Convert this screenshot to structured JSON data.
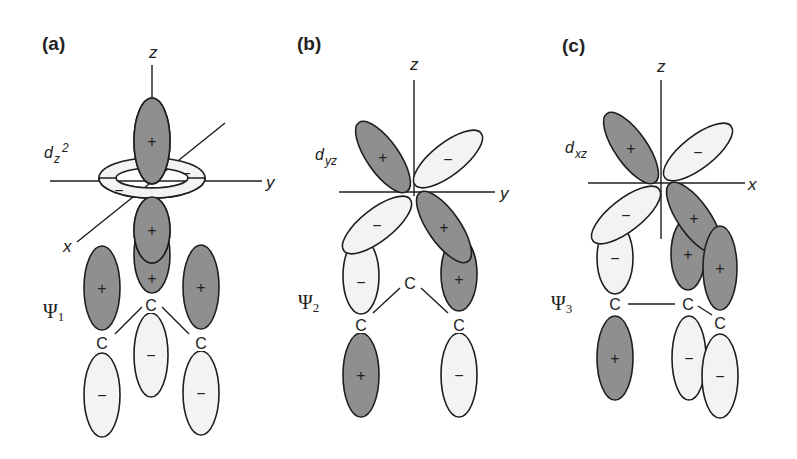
{
  "colors": {
    "positive": "#8f8f8f",
    "negative": "#f3f3f3",
    "stroke": "#1e1e1e",
    "background": "#ffffff"
  },
  "panels": [
    {
      "id": "a",
      "label": "(a)",
      "label_pos": [
        42,
        50
      ],
      "orbital": {
        "main": "d",
        "sub": "z",
        "sup": "2",
        "pos": [
          44,
          158
        ]
      },
      "psi": {
        "main": "Ψ",
        "sub": "1",
        "pos": [
          43,
          318
        ]
      },
      "axes": [
        {
          "x1": 152,
          "y1": 65,
          "x2": 152,
          "y2": 100,
          "label": "z",
          "lx": 149,
          "ly": 58
        },
        {
          "x1": 50,
          "y1": 181,
          "x2": 262,
          "y2": 181,
          "label": "y",
          "lx": 266,
          "ly": 188
        },
        {
          "x1": 225,
          "y1": 123,
          "x2": 77,
          "y2": 242,
          "label": "x",
          "lx": 63,
          "ly": 252
        }
      ],
      "ring": {
        "cx": 152,
        "cy": 178,
        "rx": 53,
        "ry": 20,
        "irx": 36,
        "iry": 10,
        "signs": [
          {
            "t": "−",
            "x": 119,
            "y": 191
          },
          {
            "t": "−",
            "x": 186,
            "y": 174
          }
        ]
      },
      "lobes": [
        {
          "cx": 102,
          "cy": 288,
          "rx": 18,
          "ry": 42,
          "rot": 0,
          "sign": "+"
        },
        {
          "cx": 201,
          "cy": 287,
          "rx": 18,
          "ry": 42,
          "rot": 0,
          "sign": "+"
        },
        {
          "cx": 152,
          "cy": 255,
          "rx": 18,
          "ry": 38,
          "rot": 0,
          "sign": "+",
          "sy": 278
        },
        {
          "cx": 152,
          "cy": 230,
          "rx": 18,
          "ry": 33,
          "rot": 0,
          "sign": "+"
        },
        {
          "cx": 152,
          "cy": 141,
          "rx": 18,
          "ry": 43,
          "rot": 0,
          "sign": "+"
        },
        {
          "cx": 102,
          "cy": 395,
          "rx": 18,
          "ry": 42,
          "rot": 0,
          "sign": "−"
        },
        {
          "cx": 151,
          "cy": 355,
          "rx": 17,
          "ry": 42,
          "rot": 0,
          "sign": "−"
        },
        {
          "cx": 201,
          "cy": 393,
          "rx": 18,
          "ry": 42,
          "rot": 0,
          "sign": "−"
        }
      ],
      "atoms": [
        {
          "t": "C",
          "x": 151,
          "y": 311
        },
        {
          "t": "C",
          "x": 102,
          "y": 349
        },
        {
          "t": "C",
          "x": 201,
          "y": 349
        }
      ],
      "bonds": [
        [
          142,
          307,
          115,
          334
        ],
        [
          162,
          307,
          189,
          334
        ]
      ]
    },
    {
      "id": "b",
      "label": "(b)",
      "label_pos": [
        297,
        50
      ],
      "orbital": {
        "main": "d",
        "sub": "yz",
        "sup": "",
        "pos": [
          315,
          160
        ]
      },
      "psi": {
        "main": "Ψ",
        "sub": "2",
        "pos": [
          298,
          309
        ]
      },
      "axes": [
        {
          "x1": 414,
          "y1": 80,
          "x2": 414,
          "y2": 196,
          "label": "z",
          "lx": 410,
          "ly": 70
        },
        {
          "x1": 339,
          "y1": 192,
          "x2": 495,
          "y2": 192,
          "label": "y",
          "lx": 500,
          "ly": 199
        }
      ],
      "lobes": [
        {
          "cx": 361,
          "cy": 276,
          "rx": 18,
          "ry": 38,
          "rot": 0,
          "sign": "−",
          "sy": 282
        },
        {
          "cx": 459,
          "cy": 274,
          "rx": 18,
          "ry": 37,
          "rot": 0,
          "sign": "+",
          "sy": 279
        },
        {
          "cx": 383,
          "cy": 157,
          "rx": 16,
          "ry": 42,
          "rot": -35,
          "sign": "+"
        },
        {
          "cx": 448,
          "cy": 159,
          "rx": 16,
          "ry": 42,
          "rot": 52,
          "sign": "−"
        },
        {
          "cx": 377,
          "cy": 225,
          "rx": 16,
          "ry": 42,
          "rot": 52,
          "sign": "−"
        },
        {
          "cx": 444,
          "cy": 227,
          "rx": 16,
          "ry": 42,
          "rot": -35,
          "sign": "+"
        },
        {
          "cx": 361,
          "cy": 375,
          "rx": 18,
          "ry": 42,
          "rot": 0,
          "sign": "+"
        },
        {
          "cx": 459,
          "cy": 375,
          "rx": 18,
          "ry": 42,
          "rot": 0,
          "sign": "−"
        }
      ],
      "atoms": [
        {
          "t": "C",
          "x": 410,
          "y": 289
        },
        {
          "t": "C",
          "x": 361,
          "y": 331
        },
        {
          "t": "C",
          "x": 459,
          "y": 331
        }
      ],
      "bonds": [
        [
          400,
          288,
          373,
          313
        ],
        [
          421,
          288,
          448,
          313
        ]
      ]
    },
    {
      "id": "c",
      "label": "(c)",
      "label_pos": [
        562,
        52
      ],
      "orbital": {
        "main": "d",
        "sub": "xz",
        "sup": "",
        "pos": [
          565,
          153
        ]
      },
      "psi": {
        "main": "Ψ",
        "sub": "3",
        "pos": [
          551,
          310
        ]
      },
      "axes": [
        {
          "x1": 661,
          "y1": 80,
          "x2": 661,
          "y2": 239,
          "label": "z",
          "lx": 657,
          "ly": 72
        },
        {
          "x1": 588,
          "y1": 183,
          "x2": 745,
          "y2": 183,
          "label": "x",
          "lx": 748,
          "ly": 190
        }
      ],
      "lobes": [
        {
          "cx": 615,
          "cy": 258,
          "rx": 18,
          "ry": 36,
          "rot": 0,
          "sign": "−"
        },
        {
          "cx": 688,
          "cy": 254,
          "rx": 17,
          "ry": 36,
          "rot": 0,
          "sign": "+"
        },
        {
          "cx": 631,
          "cy": 148,
          "rx": 16,
          "ry": 42,
          "rot": -35,
          "sign": "+"
        },
        {
          "cx": 698,
          "cy": 152,
          "rx": 16,
          "ry": 42,
          "rot": 52,
          "sign": "−"
        },
        {
          "cx": 626,
          "cy": 215,
          "rx": 16,
          "ry": 42,
          "rot": 52,
          "sign": "−"
        },
        {
          "cx": 694,
          "cy": 218,
          "rx": 16,
          "ry": 42,
          "rot": -35,
          "sign": "+"
        },
        {
          "cx": 720,
          "cy": 268,
          "rx": 17,
          "ry": 42,
          "rot": 0,
          "sign": "+"
        },
        {
          "cx": 615,
          "cy": 358,
          "rx": 18,
          "ry": 42,
          "rot": 0,
          "sign": "+"
        },
        {
          "cx": 689,
          "cy": 358,
          "rx": 17,
          "ry": 42,
          "rot": 0,
          "sign": "−"
        },
        {
          "cx": 720,
          "cy": 376,
          "rx": 18,
          "ry": 42,
          "rot": 0,
          "sign": "−"
        }
      ],
      "atoms": [
        {
          "t": "C",
          "x": 615,
          "y": 310
        },
        {
          "t": "C",
          "x": 688,
          "y": 310
        },
        {
          "t": "C",
          "x": 720,
          "y": 329
        }
      ],
      "bonds": [
        [
          628,
          304,
          675,
          304
        ],
        [
          698,
          306,
          712,
          315
        ]
      ]
    }
  ]
}
